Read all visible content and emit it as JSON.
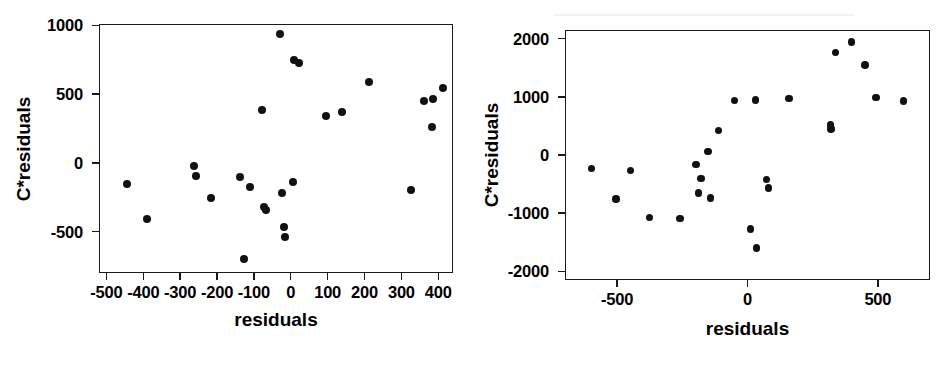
{
  "figure": {
    "background_color": "#ffffff",
    "ink_color": "#111111",
    "panel_count": 2
  },
  "chart_data": [
    {
      "id": "left-panel",
      "type": "scatter",
      "title": "",
      "xlabel": "residuals",
      "ylabel": "C*residuals",
      "xlim": [
        -520,
        440
      ],
      "ylim": [
        -800,
        1010
      ],
      "grid": false,
      "legend": false,
      "xticks": [
        -500,
        -400,
        -300,
        -200,
        -100,
        0,
        100,
        200,
        300,
        400
      ],
      "xticklabels": [
        "-500",
        "-400",
        "-300",
        "-200",
        "-100",
        "0",
        "100",
        "200",
        "300",
        "400"
      ],
      "yticks": [
        -500,
        0,
        500,
        1000
      ],
      "yticklabels": [
        "-500",
        "0",
        "500",
        "1000"
      ],
      "marker": "filled-circle",
      "marker_color": "#111111",
      "points": [
        {
          "x": -445,
          "y": -155
        },
        {
          "x": -390,
          "y": -405
        },
        {
          "x": -262,
          "y": -20
        },
        {
          "x": -258,
          "y": -95
        },
        {
          "x": -215,
          "y": -255
        },
        {
          "x": -137,
          "y": -100
        },
        {
          "x": -128,
          "y": -700
        },
        {
          "x": -110,
          "y": -175
        },
        {
          "x": -78,
          "y": 385
        },
        {
          "x": -72,
          "y": -320
        },
        {
          "x": -68,
          "y": -345
        },
        {
          "x": -30,
          "y": 935
        },
        {
          "x": -25,
          "y": -215
        },
        {
          "x": -18,
          "y": -465
        },
        {
          "x": -15,
          "y": -535
        },
        {
          "x": 5,
          "y": -140
        },
        {
          "x": 8,
          "y": 750
        },
        {
          "x": 22,
          "y": 725
        },
        {
          "x": 95,
          "y": 340
        },
        {
          "x": 140,
          "y": 370
        },
        {
          "x": 212,
          "y": 590
        },
        {
          "x": 325,
          "y": -200
        },
        {
          "x": 362,
          "y": 450
        },
        {
          "x": 385,
          "y": 465
        },
        {
          "x": 382,
          "y": 258
        },
        {
          "x": 412,
          "y": 548
        }
      ]
    },
    {
      "id": "right-panel",
      "type": "scatter",
      "title": "",
      "xlabel": "residuals",
      "ylabel": "C*residuals",
      "xlim": [
        -700,
        700
      ],
      "ylim": [
        -2150,
        2150
      ],
      "grid": false,
      "legend": false,
      "xticks": [
        -500,
        0,
        500
      ],
      "xticklabels": [
        "-500",
        "0",
        "500"
      ],
      "yticks": [
        -2000,
        -1000,
        0,
        1000,
        2000
      ],
      "yticklabels": [
        "-2000",
        "-1000",
        "0",
        "1000",
        "2000"
      ],
      "marker": "filled-circle",
      "marker_color": "#111111",
      "points": [
        {
          "x": -598,
          "y": -230
        },
        {
          "x": -505,
          "y": -760
        },
        {
          "x": -448,
          "y": -265
        },
        {
          "x": -375,
          "y": -1075
        },
        {
          "x": -258,
          "y": -1090
        },
        {
          "x": -198,
          "y": -165
        },
        {
          "x": -178,
          "y": -400
        },
        {
          "x": -188,
          "y": -650
        },
        {
          "x": -152,
          "y": 60
        },
        {
          "x": -142,
          "y": -740
        },
        {
          "x": -112,
          "y": 420
        },
        {
          "x": -50,
          "y": 935
        },
        {
          "x": 12,
          "y": -1270
        },
        {
          "x": 30,
          "y": 950
        },
        {
          "x": 35,
          "y": -1600
        },
        {
          "x": 72,
          "y": -425
        },
        {
          "x": 80,
          "y": -570
        },
        {
          "x": 160,
          "y": 970
        },
        {
          "x": 318,
          "y": 515
        },
        {
          "x": 320,
          "y": 445
        },
        {
          "x": 338,
          "y": 1760
        },
        {
          "x": 398,
          "y": 1945
        },
        {
          "x": 450,
          "y": 1550
        },
        {
          "x": 492,
          "y": 990
        },
        {
          "x": 598,
          "y": 925
        }
      ]
    }
  ]
}
